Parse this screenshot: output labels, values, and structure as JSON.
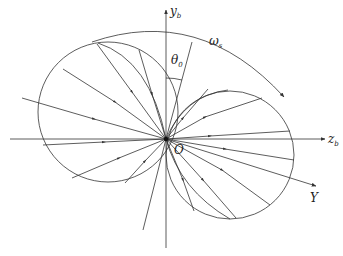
{
  "diagram": {
    "type": "rotating body-frame ray pattern with two circular lobes",
    "labels": {
      "y_axis": "y",
      "y_axis_sub": "b",
      "z_axis": "z",
      "z_axis_sub": "b",
      "Y_axis": "Y",
      "origin": "O",
      "theta": "θ",
      "theta_sub": "0",
      "omega": "ω",
      "omega_sub": "s"
    },
    "colors": {
      "line": "#333333",
      "background": "#ffffff"
    },
    "origin": [
      166,
      139
    ],
    "left_lobe": {
      "cx": 108,
      "cy": 112,
      "r": 70
    },
    "right_lobe": {
      "cx": 230,
      "cy": 155,
      "r": 64
    }
  }
}
